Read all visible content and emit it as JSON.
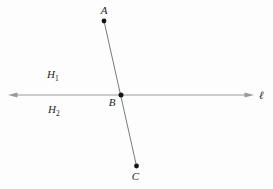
{
  "figure": {
    "points": {
      "A": "A",
      "B": "B",
      "C": "C"
    },
    "line_label": "ℓ",
    "half_planes": {
      "h1": {
        "main": "H",
        "sub": "1"
      },
      "h2": {
        "main": "H",
        "sub": "2"
      }
    },
    "colors": {
      "line": "#999999",
      "segment": "#7a7a7a",
      "point": "#151515",
      "text": "#242424",
      "background": "#fdfdfd"
    }
  }
}
